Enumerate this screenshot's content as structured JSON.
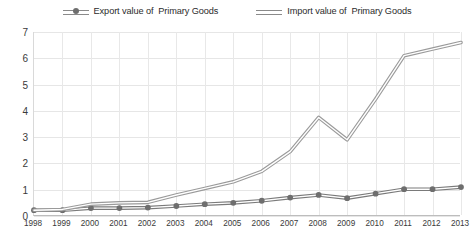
{
  "chart_data": {
    "type": "line",
    "title": "",
    "subtitle": "",
    "xlabel": "",
    "ylabel": "",
    "categories": [
      "1998",
      "1999",
      "2000",
      "2001",
      "2002",
      "2003",
      "2004",
      "2005",
      "2006",
      "2007",
      "2008",
      "2009",
      "2010",
      "2011",
      "2012",
      "2013"
    ],
    "ylim": [
      0,
      7
    ],
    "yticks": [
      0,
      1,
      2,
      3,
      4,
      5,
      6,
      7
    ],
    "grid": "both",
    "legend_position": "top-center",
    "series": [
      {
        "name": "Export value of  Primary Goods",
        "marker": "circle",
        "color": "#7a7a7a",
        "values": [
          0.22,
          0.22,
          0.3,
          0.3,
          0.32,
          0.38,
          0.45,
          0.5,
          0.58,
          0.7,
          0.8,
          0.68,
          0.85,
          1.02,
          1.02,
          1.1
        ]
      },
      {
        "name": "Import value of  Primary Goods",
        "marker": "none",
        "color": "#9a9a9a",
        "values": [
          0.22,
          0.25,
          0.45,
          0.5,
          0.52,
          0.8,
          1.05,
          1.3,
          1.7,
          2.45,
          3.75,
          2.9,
          4.45,
          6.1,
          6.35,
          6.6
        ]
      }
    ]
  },
  "legend": {
    "entries": [
      {
        "label": "Export value of  Primary Goods",
        "swatch": "dashed-line-with-dot"
      },
      {
        "label": "Import value of  Primary Goods",
        "swatch": "solid-double-line"
      }
    ]
  },
  "colors": {
    "line": "#8a8a8a",
    "marker": "#6e6e6e",
    "gridline": "#e6e6e6",
    "axis": "#bdbdbd",
    "text": "#3a3a3a",
    "background": "#ffffff"
  }
}
